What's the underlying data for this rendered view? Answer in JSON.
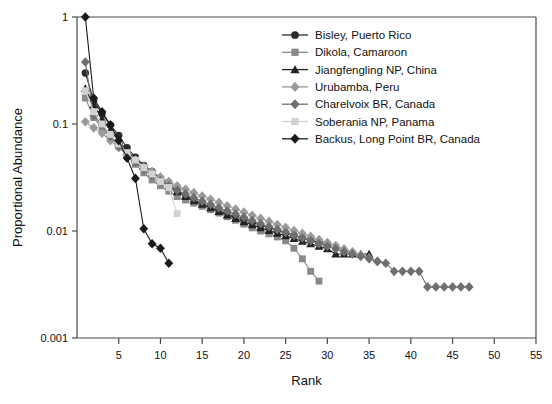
{
  "chart_data": {
    "type": "line",
    "title": "",
    "xlabel": "Rank",
    "ylabel": "Proportional Abundance",
    "xlim": [
      0,
      55
    ],
    "ylim": [
      0.001,
      1
    ],
    "yscale": "log",
    "grid": false,
    "legend_position": "top-right",
    "xticks": [
      5,
      10,
      15,
      20,
      25,
      30,
      35,
      40,
      45,
      50,
      55
    ],
    "yticks": [
      "1",
      "0.1",
      "0.01",
      "0.001"
    ],
    "ytick_values": [
      1,
      0.1,
      0.01,
      0.001
    ],
    "series": [
      {
        "name": "Bisley, Puerto Rico",
        "marker": "circle",
        "color": "#2b2b2b",
        "line_color": "#2b2b2b",
        "x": [
          1,
          2,
          3,
          4,
          5,
          6,
          7,
          8,
          9,
          10,
          11,
          12,
          13,
          14,
          15,
          16,
          17,
          18,
          19,
          20,
          21,
          22,
          23,
          24,
          25,
          26,
          27,
          28,
          29,
          30
        ],
        "values": [
          0.3,
          0.165,
          0.125,
          0.098,
          0.078,
          0.06,
          0.049,
          0.041,
          0.036,
          0.031,
          0.027,
          0.024,
          0.0215,
          0.0195,
          0.018,
          0.0167,
          0.0155,
          0.0145,
          0.0136,
          0.0128,
          0.012,
          0.0113,
          0.0107,
          0.0101,
          0.0096,
          0.0091,
          0.0086,
          0.0082,
          0.0078,
          0.0074
        ]
      },
      {
        "name": "Dikola, Camaroon",
        "marker": "square",
        "color": "#8a8a8a",
        "line_color": "#8a8a8a",
        "x": [
          1,
          2,
          3,
          4,
          5,
          6,
          7,
          8,
          9,
          10,
          11,
          12,
          13,
          14,
          15,
          16,
          17,
          18,
          19,
          20,
          21,
          22,
          23,
          24,
          25,
          26,
          27,
          28,
          29
        ],
        "values": [
          0.175,
          0.115,
          0.092,
          0.077,
          0.062,
          0.05,
          0.042,
          0.035,
          0.03,
          0.0265,
          0.0235,
          0.021,
          0.0195,
          0.0182,
          0.017,
          0.0158,
          0.0147,
          0.0136,
          0.0126,
          0.0116,
          0.0107,
          0.01,
          0.0094,
          0.0088,
          0.0081,
          0.0069,
          0.0055,
          0.0042,
          0.0034
        ]
      },
      {
        "name": "Jiangfengling NP, China",
        "marker": "triangle",
        "color": "#222222",
        "line_color": "#222222",
        "x": [
          1,
          2,
          3,
          4,
          5,
          6,
          7,
          8,
          9,
          10,
          11,
          12,
          13,
          14,
          15,
          16,
          17,
          18,
          19,
          20,
          21,
          22,
          23,
          24,
          25,
          26,
          27,
          28,
          29,
          30,
          31,
          32,
          33,
          34,
          35
        ],
        "values": [
          0.215,
          0.15,
          0.112,
          0.088,
          0.07,
          0.056,
          0.047,
          0.04,
          0.034,
          0.0295,
          0.026,
          0.0232,
          0.021,
          0.0192,
          0.0178,
          0.0165,
          0.0152,
          0.0141,
          0.0131,
          0.0122,
          0.0114,
          0.0107,
          0.0101,
          0.0095,
          0.009,
          0.0085,
          0.008,
          0.0076,
          0.0072,
          0.0068,
          0.0061,
          0.0061,
          0.0061,
          0.0061,
          0.0061
        ]
      },
      {
        "name": "Urubamba, Peru",
        "marker": "diamond",
        "color": "#9a9a9a",
        "line_color": "#9a9a9a",
        "x": [
          1,
          2,
          3,
          4,
          5,
          6,
          7,
          8,
          9,
          10,
          11,
          12,
          13,
          14,
          15,
          16,
          17,
          18,
          19,
          20,
          21,
          22,
          23,
          24,
          25,
          26,
          27,
          28,
          29,
          30,
          31,
          32,
          33,
          34,
          35,
          36
        ],
        "values": [
          0.105,
          0.092,
          0.082,
          0.07,
          0.06,
          0.052,
          0.046,
          0.04,
          0.036,
          0.032,
          0.029,
          0.0265,
          0.0245,
          0.0228,
          0.0212,
          0.0198,
          0.0185,
          0.0172,
          0.016,
          0.015,
          0.014,
          0.0131,
          0.0123,
          0.0115,
          0.0108,
          0.0101,
          0.0095,
          0.0089,
          0.0083,
          0.0078,
          0.0073,
          0.0068,
          0.0064,
          0.006,
          0.0056,
          0.0052
        ]
      },
      {
        "name": "Charelvoix BR, Canada",
        "marker": "diamond",
        "color": "#6f6f6f",
        "line_color": "#6f6f6f",
        "x": [
          1,
          2,
          3,
          4,
          5,
          6,
          7,
          8,
          9,
          10,
          11,
          12,
          13,
          14,
          15,
          16,
          17,
          18,
          19,
          20,
          21,
          22,
          23,
          24,
          25,
          26,
          27,
          28,
          29,
          30,
          31,
          32,
          33,
          34,
          35,
          36,
          37,
          38,
          39,
          40,
          41,
          42,
          43,
          44,
          45,
          46,
          47
        ],
        "values": [
          0.38,
          0.12,
          0.098,
          0.077,
          0.062,
          0.052,
          0.044,
          0.038,
          0.033,
          0.0295,
          0.0265,
          0.024,
          0.0222,
          0.0205,
          0.019,
          0.0177,
          0.0165,
          0.0154,
          0.0144,
          0.0134,
          0.0125,
          0.0117,
          0.011,
          0.0103,
          0.0097,
          0.0091,
          0.0086,
          0.0081,
          0.0076,
          0.0072,
          0.0068,
          0.0064,
          0.0061,
          0.0058,
          0.0055,
          0.0052,
          0.005,
          0.0042,
          0.0042,
          0.0042,
          0.0042,
          0.003,
          0.003,
          0.003,
          0.003,
          0.003,
          0.003
        ]
      },
      {
        "name": "Soberania NP, Panama",
        "marker": "square",
        "color": "#d2d2d2",
        "line_color": "#d2d2d2",
        "x": [
          1,
          2,
          3,
          4,
          5,
          6,
          7,
          8,
          9,
          10,
          11,
          12
        ],
        "values": [
          0.205,
          0.13,
          0.1,
          0.08,
          0.065,
          0.054,
          0.046,
          0.039,
          0.034,
          0.029,
          0.0255,
          0.0145
        ]
      },
      {
        "name": "Backus, Long Point BR, Canada",
        "marker": "diamond",
        "color": "#1a1a1a",
        "line_color": "#1a1a1a",
        "x": [
          1,
          2,
          3,
          4,
          5,
          6,
          7,
          8,
          9,
          10,
          11
        ],
        "values": [
          1.0,
          0.175,
          0.13,
          0.098,
          0.07,
          0.048,
          0.031,
          0.0105,
          0.0076,
          0.0069,
          0.005
        ]
      }
    ]
  }
}
